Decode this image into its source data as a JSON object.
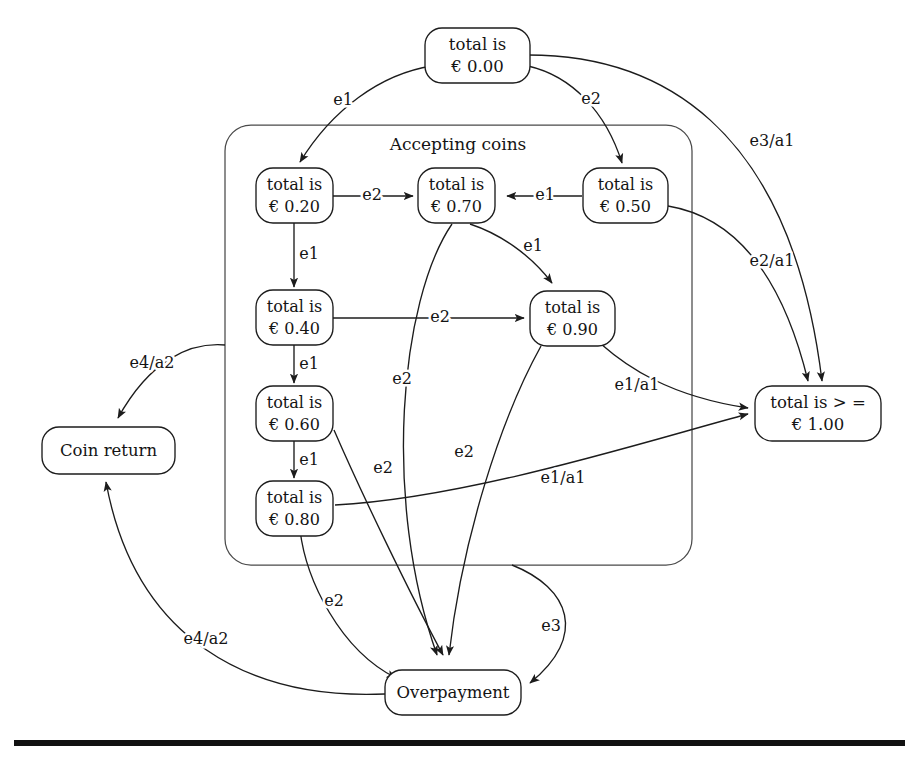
{
  "diagram": {
    "region": {
      "name": "accepting-coins-region",
      "label": "Accepting coins"
    },
    "nodes": [
      {
        "id": "s000",
        "name": "state-total-000",
        "line1": "total is",
        "line2": "€ 0.00"
      },
      {
        "id": "s020",
        "name": "state-total-020",
        "line1": "total is",
        "line2": "€ 0.20"
      },
      {
        "id": "s070",
        "name": "state-total-070",
        "line1": "total is",
        "line2": "€ 0.70"
      },
      {
        "id": "s050",
        "name": "state-total-050",
        "line1": "total is",
        "line2": "€ 0.50"
      },
      {
        "id": "s040",
        "name": "state-total-040",
        "line1": "total is",
        "line2": "€ 0.40"
      },
      {
        "id": "s090",
        "name": "state-total-090",
        "line1": "total is",
        "line2": "€ 0.90"
      },
      {
        "id": "s060",
        "name": "state-total-060",
        "line1": "total is",
        "line2": "€ 0.60"
      },
      {
        "id": "s080",
        "name": "state-total-080",
        "line1": "total is",
        "line2": "€ 0.80"
      },
      {
        "id": "s100",
        "name": "state-total-ge-100",
        "line1": "total is > =",
        "line2": "€ 1.00"
      },
      {
        "id": "coin",
        "name": "state-coin-return",
        "line1": "Coin return",
        "line2": ""
      },
      {
        "id": "over",
        "name": "state-overpayment",
        "line1": "Overpayment",
        "line2": ""
      }
    ],
    "edges": [
      {
        "id": "e_000_020",
        "name": "transition-000-to-020",
        "from": "s000",
        "to": "s020",
        "label": "e1"
      },
      {
        "id": "e_000_050",
        "name": "transition-000-to-050",
        "from": "s000",
        "to": "s050",
        "label": "e2"
      },
      {
        "id": "e_000_100",
        "name": "transition-000-to-100",
        "from": "s000",
        "to": "s100",
        "label": "e3/a1"
      },
      {
        "id": "e_020_070",
        "name": "transition-020-to-070",
        "from": "s020",
        "to": "s070",
        "label": "e2"
      },
      {
        "id": "e_050_070",
        "name": "transition-050-to-070",
        "from": "s050",
        "to": "s070",
        "label": "e1"
      },
      {
        "id": "e_050_100",
        "name": "transition-050-to-100",
        "from": "s050",
        "to": "s100",
        "label": "e2/a1"
      },
      {
        "id": "e_020_040",
        "name": "transition-020-to-040",
        "from": "s020",
        "to": "s040",
        "label": "e1"
      },
      {
        "id": "e_040_060",
        "name": "transition-040-to-060",
        "from": "s040",
        "to": "s060",
        "label": "e1"
      },
      {
        "id": "e_060_080",
        "name": "transition-060-to-080",
        "from": "s060",
        "to": "s080",
        "label": "e1"
      },
      {
        "id": "e_040_090",
        "name": "transition-040-to-090",
        "from": "s040",
        "to": "s090",
        "label": "e2"
      },
      {
        "id": "e_070_090",
        "name": "transition-070-to-090",
        "from": "s070",
        "to": "s090",
        "label": "e1"
      },
      {
        "id": "e_070_over",
        "name": "transition-070-to-overpayment",
        "from": "s070",
        "to": "over",
        "label": "e2"
      },
      {
        "id": "e_090_over",
        "name": "transition-090-to-overpayment",
        "from": "s090",
        "to": "over",
        "label": "e2"
      },
      {
        "id": "e_060_over",
        "name": "transition-060-to-overpayment",
        "from": "s060",
        "to": "over",
        "label": "e2"
      },
      {
        "id": "e_080_over",
        "name": "transition-080-to-overpayment",
        "from": "s080",
        "to": "over",
        "label": "e2"
      },
      {
        "id": "e_090_100",
        "name": "transition-090-to-100",
        "from": "s090",
        "to": "s100",
        "label": "e1/a1"
      },
      {
        "id": "e_080_100",
        "name": "transition-080-to-100",
        "from": "s080",
        "to": "s100",
        "label": "e1/a1"
      },
      {
        "id": "e_region_coin",
        "name": "transition-region-to-coin-return",
        "from": "accepting-coins",
        "to": "coin",
        "label": "e4/a2"
      },
      {
        "id": "e_over_coin",
        "name": "transition-overpayment-to-coin-return",
        "from": "over",
        "to": "coin",
        "label": "e4/a2"
      },
      {
        "id": "e_region_over",
        "name": "transition-region-to-overpayment",
        "from": "accepting-coins",
        "to": "over",
        "label": "e3"
      }
    ]
  }
}
